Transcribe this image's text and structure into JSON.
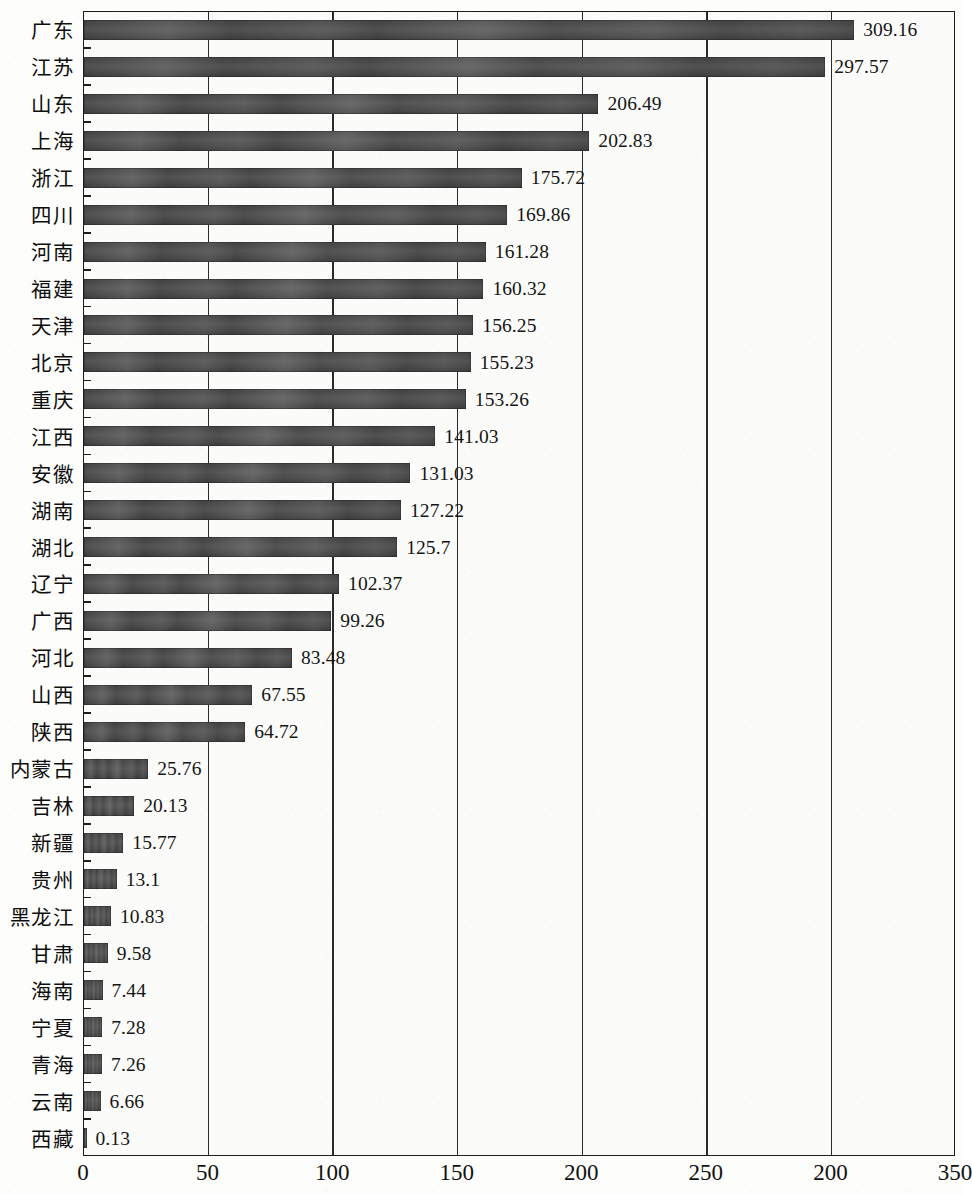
{
  "chart_data": {
    "type": "bar",
    "orientation": "horizontal",
    "title": "",
    "subtitle": "",
    "xlabel": "",
    "ylabel": "",
    "xlim": [
      0,
      350
    ],
    "grid": true,
    "legend": null,
    "legend_position": "none",
    "bar_color": "#474747",
    "background_color": "#fbfbfa",
    "axis_color": "#1d1d1d",
    "xticks": [
      {
        "value": 0,
        "label": "0"
      },
      {
        "value": 50,
        "label": "50"
      },
      {
        "value": 100,
        "label": "100"
      },
      {
        "value": 150,
        "label": "150"
      },
      {
        "value": 200,
        "label": "200"
      },
      {
        "value": 250,
        "label": "250"
      },
      {
        "value": 300,
        "label": "200"
      },
      {
        "value": 350,
        "label": "350"
      }
    ],
    "categories": [
      "广东",
      "江苏",
      "山东",
      "上海",
      "浙江",
      "四川",
      "河南",
      "福建",
      "天津",
      "北京",
      "重庆",
      "江西",
      "安徽",
      "湖南",
      "湖北",
      "辽宁",
      "广西",
      "河北",
      "山西",
      "陕西",
      "内蒙古",
      "吉林",
      "新疆",
      "贵州",
      "黑龙江",
      "甘肃",
      "海南",
      "宁夏",
      "青海",
      "云南",
      "西藏"
    ],
    "values": [
      309.16,
      297.57,
      206.49,
      202.83,
      175.72,
      169.86,
      161.28,
      160.32,
      156.25,
      155.23,
      153.26,
      141.03,
      131.03,
      127.22,
      125.7,
      102.37,
      99.26,
      83.48,
      67.55,
      64.72,
      25.76,
      20.13,
      15.77,
      13.1,
      10.83,
      9.58,
      7.44,
      7.28,
      7.26,
      6.66,
      0.13
    ],
    "value_labels": [
      "309.16",
      "297.57",
      "206.49",
      "202.83",
      "175.72",
      "169.86",
      "161.28",
      "160.32",
      "156.25",
      "155.23",
      "153.26",
      "141.03",
      "131.03",
      "127.22",
      "125.7",
      "102.37",
      "99.26",
      "83.48",
      "67.55",
      "64.72",
      "25.76",
      "20.13",
      "15.77",
      "13.1",
      "10.83",
      "9.58",
      "7.44",
      "7.28",
      "7.26",
      "6.66",
      "0.13"
    ]
  }
}
